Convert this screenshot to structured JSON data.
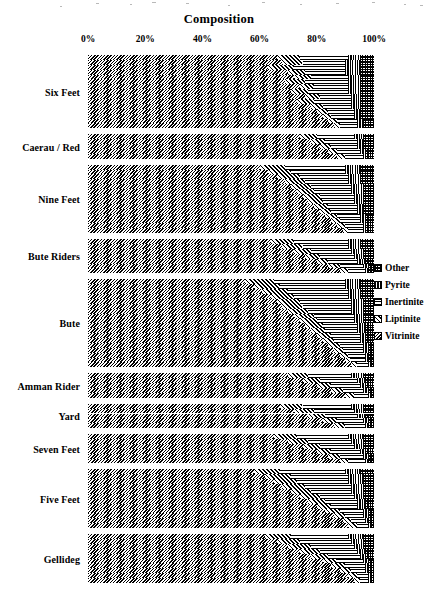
{
  "chart_data": {
    "type": "bar",
    "orientation": "horizontal",
    "stacked": true,
    "normalized": true,
    "title": "Composition",
    "xlabel": "",
    "ylabel": "",
    "xlim": [
      0,
      100
    ],
    "xticks": [
      0,
      20,
      40,
      60,
      80,
      100
    ],
    "xtick_labels": [
      "0%",
      "20%",
      "40%",
      "60%",
      "80%",
      "100%"
    ],
    "grid": false,
    "legend_position": "right",
    "legend_entries": [
      {
        "name": "Other",
        "pattern": "grid",
        "color": "#000000"
      },
      {
        "name": "Pyrite",
        "pattern": "vertical-lines",
        "color": "#000000"
      },
      {
        "name": "Inertinite",
        "pattern": "horizontal-lines",
        "color": "#000000"
      },
      {
        "name": "Liptinite",
        "pattern": "forward-diagonal",
        "color": "#000000"
      },
      {
        "name": "Vitrinite",
        "pattern": "back-diagonal",
        "color": "#000000"
      }
    ],
    "series_order": [
      "Vitrinite",
      "Liptinite",
      "Inertinite",
      "Pyrite",
      "Other"
    ],
    "categories": [
      "Six Feet",
      "Caerau / Red",
      "Nine Feet",
      "Bute Riders",
      "Bute",
      "Amman Rider",
      "Yard",
      "Seven Feet",
      "Five Feet",
      "Gellideg"
    ],
    "groups": [
      {
        "label": "Six Feet",
        "samples": [
          {
            "Vitrinite": 66,
            "Liptinite": 8,
            "Inertinite": 17,
            "Pyrite": 4,
            "Other": 5
          },
          {
            "Vitrinite": 68,
            "Liptinite": 7,
            "Inertinite": 15,
            "Pyrite": 5,
            "Other": 5
          },
          {
            "Vitrinite": 63,
            "Liptinite": 9,
            "Inertinite": 18,
            "Pyrite": 5,
            "Other": 5
          },
          {
            "Vitrinite": 70,
            "Liptinite": 6,
            "Inertinite": 14,
            "Pyrite": 5,
            "Other": 5
          },
          {
            "Vitrinite": 72,
            "Liptinite": 6,
            "Inertinite": 13,
            "Pyrite": 4,
            "Other": 5
          },
          {
            "Vitrinite": 69,
            "Liptinite": 7,
            "Inertinite": 15,
            "Pyrite": 4,
            "Other": 5
          },
          {
            "Vitrinite": 74,
            "Liptinite": 5,
            "Inertinite": 12,
            "Pyrite": 4,
            "Other": 5
          },
          {
            "Vitrinite": 71,
            "Liptinite": 6,
            "Inertinite": 14,
            "Pyrite": 4,
            "Other": 5
          },
          {
            "Vitrinite": 76,
            "Liptinite": 5,
            "Inertinite": 11,
            "Pyrite": 3,
            "Other": 5
          },
          {
            "Vitrinite": 73,
            "Liptinite": 6,
            "Inertinite": 13,
            "Pyrite": 3,
            "Other": 5
          },
          {
            "Vitrinite": 78,
            "Liptinite": 4,
            "Inertinite": 10,
            "Pyrite": 3,
            "Other": 5
          },
          {
            "Vitrinite": 80,
            "Liptinite": 4,
            "Inertinite": 9,
            "Pyrite": 2,
            "Other": 5
          },
          {
            "Vitrinite": 82,
            "Liptinite": 3,
            "Inertinite": 8,
            "Pyrite": 2,
            "Other": 5
          },
          {
            "Vitrinite": 84,
            "Liptinite": 3,
            "Inertinite": 7,
            "Pyrite": 2,
            "Other": 4
          },
          {
            "Vitrinite": 86,
            "Liptinite": 2,
            "Inertinite": 6,
            "Pyrite": 2,
            "Other": 4
          }
        ]
      },
      {
        "label": "Caerau / Red",
        "samples": [
          {
            "Vitrinite": 74,
            "Liptinite": 6,
            "Inertinite": 13,
            "Pyrite": 3,
            "Other": 4
          },
          {
            "Vitrinite": 78,
            "Liptinite": 5,
            "Inertinite": 11,
            "Pyrite": 2,
            "Other": 4
          },
          {
            "Vitrinite": 81,
            "Liptinite": 4,
            "Inertinite": 9,
            "Pyrite": 2,
            "Other": 4
          },
          {
            "Vitrinite": 84,
            "Liptinite": 3,
            "Inertinite": 8,
            "Pyrite": 2,
            "Other": 3
          },
          {
            "Vitrinite": 87,
            "Liptinite": 3,
            "Inertinite": 6,
            "Pyrite": 1,
            "Other": 3
          }
        ]
      },
      {
        "label": "Nine Feet",
        "samples": [
          {
            "Vitrinite": 60,
            "Liptinite": 9,
            "Inertinite": 21,
            "Pyrite": 5,
            "Other": 5
          },
          {
            "Vitrinite": 63,
            "Liptinite": 8,
            "Inertinite": 19,
            "Pyrite": 5,
            "Other": 5
          },
          {
            "Vitrinite": 66,
            "Liptinite": 8,
            "Inertinite": 17,
            "Pyrite": 4,
            "Other": 5
          },
          {
            "Vitrinite": 69,
            "Liptinite": 7,
            "Inertinite": 15,
            "Pyrite": 4,
            "Other": 5
          },
          {
            "Vitrinite": 71,
            "Liptinite": 7,
            "Inertinite": 14,
            "Pyrite": 4,
            "Other": 4
          },
          {
            "Vitrinite": 73,
            "Liptinite": 6,
            "Inertinite": 13,
            "Pyrite": 4,
            "Other": 4
          },
          {
            "Vitrinite": 75,
            "Liptinite": 6,
            "Inertinite": 12,
            "Pyrite": 3,
            "Other": 4
          },
          {
            "Vitrinite": 77,
            "Liptinite": 5,
            "Inertinite": 11,
            "Pyrite": 3,
            "Other": 4
          },
          {
            "Vitrinite": 79,
            "Liptinite": 5,
            "Inertinite": 10,
            "Pyrite": 2,
            "Other": 4
          },
          {
            "Vitrinite": 81,
            "Liptinite": 4,
            "Inertinite": 9,
            "Pyrite": 2,
            "Other": 4
          },
          {
            "Vitrinite": 83,
            "Liptinite": 4,
            "Inertinite": 8,
            "Pyrite": 2,
            "Other": 3
          },
          {
            "Vitrinite": 85,
            "Liptinite": 3,
            "Inertinite": 7,
            "Pyrite": 2,
            "Other": 3
          },
          {
            "Vitrinite": 87,
            "Liptinite": 3,
            "Inertinite": 6,
            "Pyrite": 1,
            "Other": 3
          },
          {
            "Vitrinite": 89,
            "Liptinite": 2,
            "Inertinite": 5,
            "Pyrite": 1,
            "Other": 3
          }
        ]
      },
      {
        "label": "Bute Riders",
        "samples": [
          {
            "Vitrinite": 64,
            "Liptinite": 8,
            "Inertinite": 19,
            "Pyrite": 4,
            "Other": 5
          },
          {
            "Vitrinite": 68,
            "Liptinite": 7,
            "Inertinite": 16,
            "Pyrite": 4,
            "Other": 5
          },
          {
            "Vitrinite": 72,
            "Liptinite": 6,
            "Inertinite": 14,
            "Pyrite": 4,
            "Other": 4
          },
          {
            "Vitrinite": 76,
            "Liptinite": 5,
            "Inertinite": 12,
            "Pyrite": 3,
            "Other": 4
          },
          {
            "Vitrinite": 80,
            "Liptinite": 4,
            "Inertinite": 10,
            "Pyrite": 3,
            "Other": 3
          },
          {
            "Vitrinite": 84,
            "Liptinite": 4,
            "Inertinite": 8,
            "Pyrite": 2,
            "Other": 2
          },
          {
            "Vitrinite": 88,
            "Liptinite": 3,
            "Inertinite": 6,
            "Pyrite": 1,
            "Other": 2
          }
        ]
      },
      {
        "label": "Bute",
        "samples": [
          {
            "Vitrinite": 55,
            "Liptinite": 10,
            "Inertinite": 25,
            "Pyrite": 5,
            "Other": 5
          },
          {
            "Vitrinite": 58,
            "Liptinite": 9,
            "Inertinite": 23,
            "Pyrite": 5,
            "Other": 5
          },
          {
            "Vitrinite": 61,
            "Liptinite": 9,
            "Inertinite": 21,
            "Pyrite": 4,
            "Other": 5
          },
          {
            "Vitrinite": 64,
            "Liptinite": 8,
            "Inertinite": 19,
            "Pyrite": 4,
            "Other": 5
          },
          {
            "Vitrinite": 66,
            "Liptinite": 8,
            "Inertinite": 18,
            "Pyrite": 4,
            "Other": 4
          },
          {
            "Vitrinite": 68,
            "Liptinite": 7,
            "Inertinite": 17,
            "Pyrite": 4,
            "Other": 4
          },
          {
            "Vitrinite": 70,
            "Liptinite": 7,
            "Inertinite": 15,
            "Pyrite": 4,
            "Other": 4
          },
          {
            "Vitrinite": 72,
            "Liptinite": 7,
            "Inertinite": 14,
            "Pyrite": 3,
            "Other": 4
          },
          {
            "Vitrinite": 74,
            "Liptinite": 6,
            "Inertinite": 13,
            "Pyrite": 3,
            "Other": 4
          },
          {
            "Vitrinite": 76,
            "Liptinite": 6,
            "Inertinite": 12,
            "Pyrite": 3,
            "Other": 3
          },
          {
            "Vitrinite": 78,
            "Liptinite": 5,
            "Inertinite": 11,
            "Pyrite": 3,
            "Other": 3
          },
          {
            "Vitrinite": 80,
            "Liptinite": 5,
            "Inertinite": 10,
            "Pyrite": 2,
            "Other": 3
          },
          {
            "Vitrinite": 82,
            "Liptinite": 4,
            "Inertinite": 9,
            "Pyrite": 2,
            "Other": 3
          },
          {
            "Vitrinite": 84,
            "Liptinite": 4,
            "Inertinite": 8,
            "Pyrite": 2,
            "Other": 2
          },
          {
            "Vitrinite": 86,
            "Liptinite": 3,
            "Inertinite": 7,
            "Pyrite": 2,
            "Other": 2
          },
          {
            "Vitrinite": 88,
            "Liptinite": 3,
            "Inertinite": 6,
            "Pyrite": 1,
            "Other": 2
          },
          {
            "Vitrinite": 90,
            "Liptinite": 2,
            "Inertinite": 5,
            "Pyrite": 1,
            "Other": 2
          },
          {
            "Vitrinite": 92,
            "Liptinite": 2,
            "Inertinite": 4,
            "Pyrite": 1,
            "Other": 1
          }
        ]
      },
      {
        "label": "Amman Rider",
        "samples": [
          {
            "Vitrinite": 70,
            "Liptinite": 7,
            "Inertinite": 15,
            "Pyrite": 4,
            "Other": 4
          },
          {
            "Vitrinite": 75,
            "Liptinite": 6,
            "Inertinite": 13,
            "Pyrite": 3,
            "Other": 3
          },
          {
            "Vitrinite": 80,
            "Liptinite": 5,
            "Inertinite": 10,
            "Pyrite": 2,
            "Other": 3
          },
          {
            "Vitrinite": 85,
            "Liptinite": 4,
            "Inertinite": 7,
            "Pyrite": 2,
            "Other": 2
          },
          {
            "Vitrinite": 90,
            "Liptinite": 3,
            "Inertinite": 5,
            "Pyrite": 1,
            "Other": 1
          }
        ]
      },
      {
        "label": "Yard",
        "samples": [
          {
            "Vitrinite": 67,
            "Liptinite": 8,
            "Inertinite": 17,
            "Pyrite": 4,
            "Other": 4
          },
          {
            "Vitrinite": 72,
            "Liptinite": 7,
            "Inertinite": 14,
            "Pyrite": 3,
            "Other": 4
          },
          {
            "Vitrinite": 77,
            "Liptinite": 6,
            "Inertinite": 11,
            "Pyrite": 3,
            "Other": 3
          },
          {
            "Vitrinite": 82,
            "Liptinite": 5,
            "Inertinite": 9,
            "Pyrite": 2,
            "Other": 2
          },
          {
            "Vitrinite": 86,
            "Liptinite": 4,
            "Inertinite": 7,
            "Pyrite": 1,
            "Other": 2
          }
        ]
      },
      {
        "label": "Seven Feet",
        "samples": [
          {
            "Vitrinite": 65,
            "Liptinite": 8,
            "Inertinite": 18,
            "Pyrite": 5,
            "Other": 4
          },
          {
            "Vitrinite": 70,
            "Liptinite": 7,
            "Inertinite": 15,
            "Pyrite": 4,
            "Other": 4
          },
          {
            "Vitrinite": 75,
            "Liptinite": 6,
            "Inertinite": 12,
            "Pyrite": 3,
            "Other": 4
          },
          {
            "Vitrinite": 80,
            "Liptinite": 5,
            "Inertinite": 10,
            "Pyrite": 2,
            "Other": 3
          },
          {
            "Vitrinite": 84,
            "Liptinite": 4,
            "Inertinite": 8,
            "Pyrite": 2,
            "Other": 2
          },
          {
            "Vitrinite": 88,
            "Liptinite": 3,
            "Inertinite": 6,
            "Pyrite": 1,
            "Other": 2
          }
        ]
      },
      {
        "label": "Five Feet",
        "samples": [
          {
            "Vitrinite": 58,
            "Liptinite": 9,
            "Inertinite": 23,
            "Pyrite": 5,
            "Other": 5
          },
          {
            "Vitrinite": 62,
            "Liptinite": 9,
            "Inertinite": 20,
            "Pyrite": 5,
            "Other": 4
          },
          {
            "Vitrinite": 65,
            "Liptinite": 8,
            "Inertinite": 18,
            "Pyrite": 5,
            "Other": 4
          },
          {
            "Vitrinite": 68,
            "Liptinite": 8,
            "Inertinite": 16,
            "Pyrite": 4,
            "Other": 4
          },
          {
            "Vitrinite": 71,
            "Liptinite": 7,
            "Inertinite": 14,
            "Pyrite": 4,
            "Other": 4
          },
          {
            "Vitrinite": 74,
            "Liptinite": 7,
            "Inertinite": 12,
            "Pyrite": 3,
            "Other": 4
          },
          {
            "Vitrinite": 77,
            "Liptinite": 6,
            "Inertinite": 11,
            "Pyrite": 3,
            "Other": 3
          },
          {
            "Vitrinite": 80,
            "Liptinite": 5,
            "Inertinite": 9,
            "Pyrite": 3,
            "Other": 3
          },
          {
            "Vitrinite": 83,
            "Liptinite": 5,
            "Inertinite": 8,
            "Pyrite": 2,
            "Other": 2
          },
          {
            "Vitrinite": 86,
            "Liptinite": 4,
            "Inertinite": 6,
            "Pyrite": 2,
            "Other": 2
          },
          {
            "Vitrinite": 89,
            "Liptinite": 3,
            "Inertinite": 5,
            "Pyrite": 1,
            "Other": 2
          },
          {
            "Vitrinite": 91,
            "Liptinite": 3,
            "Inertinite": 4,
            "Pyrite": 1,
            "Other": 1
          }
        ]
      },
      {
        "label": "Gellideg",
        "samples": [
          {
            "Vitrinite": 62,
            "Liptinite": 9,
            "Inertinite": 20,
            "Pyrite": 5,
            "Other": 4
          },
          {
            "Vitrinite": 66,
            "Liptinite": 8,
            "Inertinite": 18,
            "Pyrite": 4,
            "Other": 4
          },
          {
            "Vitrinite": 70,
            "Liptinite": 8,
            "Inertinite": 15,
            "Pyrite": 3,
            "Other": 4
          },
          {
            "Vitrinite": 74,
            "Liptinite": 7,
            "Inertinite": 13,
            "Pyrite": 3,
            "Other": 3
          },
          {
            "Vitrinite": 78,
            "Liptinite": 6,
            "Inertinite": 11,
            "Pyrite": 2,
            "Other": 3
          },
          {
            "Vitrinite": 82,
            "Liptinite": 5,
            "Inertinite": 9,
            "Pyrite": 2,
            "Other": 2
          },
          {
            "Vitrinite": 85,
            "Liptinite": 5,
            "Inertinite": 7,
            "Pyrite": 1,
            "Other": 2
          },
          {
            "Vitrinite": 88,
            "Liptinite": 4,
            "Inertinite": 5,
            "Pyrite": 1,
            "Other": 2
          },
          {
            "Vitrinite": 91,
            "Liptinite": 3,
            "Inertinite": 4,
            "Pyrite": 1,
            "Other": 1
          },
          {
            "Vitrinite": 93,
            "Liptinite": 2,
            "Inertinite": 3,
            "Pyrite": 1,
            "Other": 1
          }
        ]
      }
    ]
  }
}
